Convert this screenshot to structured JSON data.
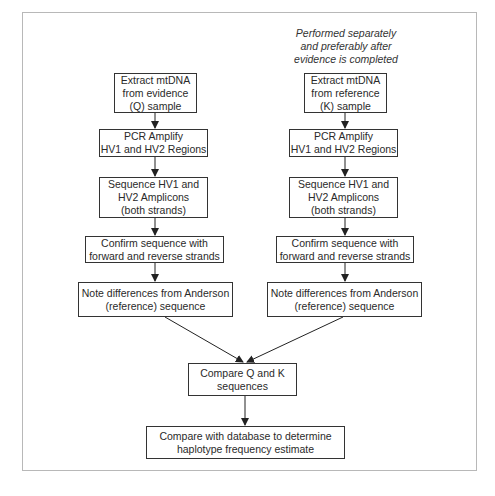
{
  "diagram": {
    "type": "flowchart",
    "annotation": "Performed separately\nand preferably after\nevidence is completed",
    "left_column": {
      "label": "Evidence (Q) workflow",
      "steps": [
        "Extract mtDNA\nfrom evidence\n(Q) sample",
        "PCR Amplify\nHV1 and HV2 Regions",
        "Sequence HV1 and\nHV2 Amplicons\n(both strands)",
        "Confirm sequence with\nforward and reverse strands",
        "Note differences from Anderson\n(reference) sequence"
      ]
    },
    "right_column": {
      "label": "Reference (K) workflow",
      "steps": [
        "Extract mtDNA\nfrom reference\n(K) sample",
        "PCR Amplify\nHV1 and HV2 Regions",
        "Sequence HV1 and\nHV2 Amplicons\n(both strands)",
        "Confirm sequence with\nforward and reverse strands",
        "Note differences from Anderson\n(reference) sequence"
      ]
    },
    "merge_steps": [
      "Compare Q and K\nsequences",
      "Compare with database to determine\nhaplotype frequency estimate"
    ],
    "colors": {
      "border": "#333333",
      "frame": "#b8b8b8",
      "text": "#2a2a2a"
    }
  }
}
